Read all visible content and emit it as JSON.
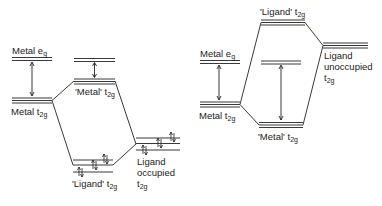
{
  "diagram": {
    "type": "molecular-orbital-energy-level-diagram",
    "left_panel": {
      "case": "pi-donor ligand (occupied ligand t2g)",
      "labels": {
        "metal_eg": "Metal e",
        "metal_eg_sub": "g",
        "metal_t2g": "Metal t",
        "metal_t2g_sub": "2g",
        "mo_metal_t2g": "'Metal' t",
        "mo_metal_t2g_sub": "2g",
        "mo_ligand_t2g": "'Ligand' t",
        "mo_ligand_t2g_sub": "2g",
        "ligand_occ_line1": "Ligand",
        "ligand_occ_line2": "occupied",
        "ligand_occ_line3": "t",
        "ligand_occ_line3_sub": "2g"
      },
      "electron_pairs": "↑↓"
    },
    "right_panel": {
      "case": "pi-acceptor ligand (unoccupied ligand t2g)",
      "labels": {
        "metal_eg": "Metal e",
        "metal_eg_sub": "g",
        "metal_t2g": "Metal t",
        "metal_t2g_sub": "2g",
        "mo_ligand_t2g": "'Ligand' t",
        "mo_ligand_t2g_sub": "2g",
        "mo_metal_t2g": "'Metal' t",
        "mo_metal_t2g_sub": "2g",
        "ligand_unocc_line1": "Ligand",
        "ligand_unocc_line2": "unoccupied",
        "ligand_unocc_line3": "t",
        "ligand_unocc_line3_sub": "2g"
      }
    },
    "colors": {
      "line": "#222222",
      "background": "#ffffff"
    }
  }
}
